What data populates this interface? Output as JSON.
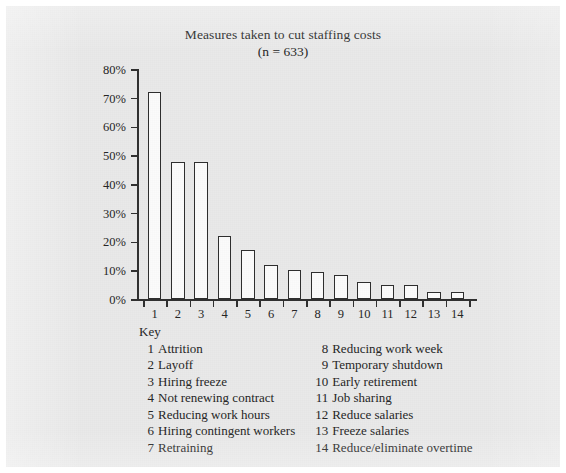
{
  "chart_data": {
    "type": "bar",
    "title": "Measures taken to cut staffing costs",
    "subtitle": "(n = 633)",
    "xlabel": "",
    "ylabel": "",
    "ylim": [
      0,
      80
    ],
    "yticks": [
      0,
      10,
      20,
      30,
      40,
      50,
      60,
      70,
      80
    ],
    "ytick_labels": [
      "0%",
      "10%",
      "20%",
      "30%",
      "40%",
      "50%",
      "60%",
      "70%",
      "80%"
    ],
    "categories": [
      "1",
      "2",
      "3",
      "4",
      "5",
      "6",
      "7",
      "8",
      "9",
      "10",
      "11",
      "12",
      "13",
      "14"
    ],
    "values": [
      72,
      47.5,
      47.5,
      22,
      17,
      12,
      10,
      9.5,
      8.5,
      6,
      5,
      5,
      2.5,
      2.5
    ],
    "grid": false,
    "legend": "below-as-key",
    "bar_fill": "#fbfbfb",
    "bar_edge": "#2e2e2e",
    "background": "#e9e9e9",
    "text_color": "#262626"
  },
  "key": {
    "heading": "Key",
    "left_column": [
      {
        "num": "1",
        "label": "Attrition"
      },
      {
        "num": "2",
        "label": "Layoff"
      },
      {
        "num": "3",
        "label": "Hiring freeze"
      },
      {
        "num": "4",
        "label": "Not renewing contract"
      },
      {
        "num": "5",
        "label": "Reducing work hours"
      },
      {
        "num": "6",
        "label": "Hiring contingent workers"
      },
      {
        "num": "7",
        "label": "Retraining"
      }
    ],
    "right_column": [
      {
        "num": "8",
        "label": "Reducing work week"
      },
      {
        "num": "9",
        "label": "Temporary shutdown"
      },
      {
        "num": "10",
        "label": "Early retirement"
      },
      {
        "num": "11",
        "label": "Job sharing"
      },
      {
        "num": "12",
        "label": "Reduce salaries"
      },
      {
        "num": "13",
        "label": "Freeze salaries"
      },
      {
        "num": "14",
        "label": "Reduce/eliminate overtime"
      }
    ]
  }
}
